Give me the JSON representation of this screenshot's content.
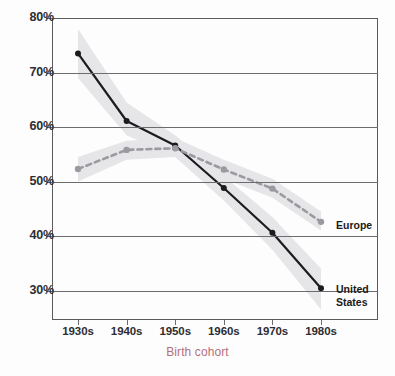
{
  "chart_data": {
    "type": "line",
    "title": "",
    "subtitle": "",
    "xlabel": "Birth cohort",
    "ylabel": "",
    "categories": [
      "1930s",
      "1940s",
      "1950s",
      "1960s",
      "1970s",
      "1980s"
    ],
    "ytick_labels": [
      "80%",
      "70%",
      "60%",
      "50%",
      "40%",
      "30%"
    ],
    "ytick_values": [
      80,
      70,
      60,
      50,
      40,
      30
    ],
    "ylim": [
      25,
      80
    ],
    "xlim": [
      0,
      5
    ],
    "grid": "horizontal",
    "legend_position": "right-inline",
    "series": [
      {
        "name": "United States",
        "label": "United\nStates",
        "color": "#1b1b20",
        "style": "solid",
        "marker": "circle",
        "values": [
          73.5,
          61.1,
          56.6,
          48.8,
          40.6,
          30.4
        ],
        "band_low": [
          69.0,
          58.5,
          54.5,
          46.5,
          37.5,
          26.5
        ],
        "band_high": [
          78.0,
          64.5,
          58.5,
          51.0,
          43.5,
          34.0
        ]
      },
      {
        "name": "Europe",
        "label": "Europe",
        "color": "#9a9aa0",
        "style": "dashed",
        "marker": "circle",
        "values": [
          52.3,
          55.8,
          56.1,
          52.2,
          48.7,
          42.6
        ],
        "band_low": [
          50.0,
          54.0,
          54.5,
          50.5,
          47.0,
          41.0
        ],
        "band_high": [
          54.5,
          57.5,
          58.0,
          54.0,
          50.5,
          44.5
        ]
      }
    ],
    "annotations": []
  },
  "colors": {
    "axis": "#5a5a5f",
    "grid": "#6b6b70",
    "tick_text": "#2d2d33",
    "axis_title": "#b2707b",
    "us_line": "#1b1b20",
    "europe_line": "#9a9aa0",
    "confidence_band": "#e6e6e8",
    "background": "#fdfdfd"
  },
  "axis": {
    "x_title": "Birth cohort",
    "y_ticks": [
      "80%",
      "70%",
      "60%",
      "50%",
      "40%",
      "30%"
    ],
    "x_ticks": [
      "1930s",
      "1940s",
      "1950s",
      "1960s",
      "1970s",
      "1980s"
    ]
  },
  "legend": {
    "europe": "Europe",
    "united_states_line1": "United",
    "united_states_line2": "States"
  }
}
